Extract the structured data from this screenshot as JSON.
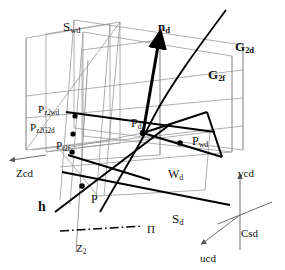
{
  "figure": {
    "type": "geometric-diagram",
    "background_color": "#ffffff",
    "line_color_thin": "#9a9a9a",
    "line_color_bold": "#000000"
  },
  "labels": {
    "plane_swd": {
      "base": "S",
      "sub": "wd",
      "x": 63,
      "y": 20,
      "size": 13,
      "bold": false
    },
    "plane_g2d": {
      "base": "G",
      "sub": "2d",
      "x": 235,
      "y": 40,
      "size": 13,
      "bold": true
    },
    "plane_g2f": {
      "base": "G",
      "sub": "2f",
      "x": 208,
      "y": 68,
      "size": 13,
      "bold": true
    },
    "plane_wd": {
      "base": "W",
      "sub": "d",
      "x": 168,
      "y": 168,
      "size": 12,
      "bold": false
    },
    "normal_nd": {
      "base": "n",
      "sub": "d",
      "x": 158,
      "y": 20,
      "size": 13,
      "bold": true
    },
    "point_pz2wd": {
      "base": "P",
      "sub": "z2wd",
      "x": 38,
      "y": 104,
      "size": 11,
      "bold": false
    },
    "point_pz2g2d": {
      "base": "P",
      "sub": "z2G2d",
      "x": 30,
      "y": 122,
      "size": 11,
      "bold": false
    },
    "point_pr2f": {
      "base": "P",
      "sub": "r2f",
      "x": 56,
      "y": 140,
      "size": 11,
      "bold": false
    },
    "point_pd": {
      "base": "P",
      "sub": "d",
      "x": 131,
      "y": 117,
      "size": 12,
      "bold": false
    },
    "point_pwd": {
      "base": "P",
      "sub": "wd",
      "x": 192,
      "y": 135,
      "size": 12,
      "bold": false
    },
    "point_p": {
      "base": "P",
      "sub": "",
      "x": 91,
      "y": 193,
      "size": 12,
      "bold": false
    },
    "line_h": {
      "base": "h",
      "sub": "",
      "x": 38,
      "y": 200,
      "size": 14,
      "bold": true
    },
    "line_sd": {
      "base": "S",
      "sub": "d",
      "x": 172,
      "y": 212,
      "size": 13,
      "bold": false
    },
    "axis_zcd": {
      "base": "Zcd",
      "sub": "",
      "x": 16,
      "y": 168,
      "size": 11,
      "bold": false
    },
    "axis_z2": {
      "base": "Z",
      "sub": "2",
      "x": 76,
      "y": 243,
      "size": 11,
      "bold": false
    },
    "plane_pi": {
      "base": "Π",
      "sub": "",
      "x": 147,
      "y": 224,
      "size": 11,
      "bold": false
    },
    "axis_vcd": {
      "base": "vcd",
      "sub": "",
      "x": 238,
      "y": 168,
      "size": 11,
      "bold": false
    },
    "axis_ucd": {
      "base": "ucd",
      "sub": "",
      "x": 200,
      "y": 253,
      "size": 11,
      "bold": false
    },
    "frame_csd": {
      "base": "Csd",
      "sub": "",
      "x": 241,
      "y": 228,
      "size": 11,
      "bold": false
    }
  },
  "geometry": {
    "points": [
      {
        "name": "P_z2wd",
        "x": 75,
        "y": 116
      },
      {
        "name": "P_z2G2d",
        "x": 73,
        "y": 134
      },
      {
        "name": "P_r2f",
        "x": 72,
        "y": 152
      },
      {
        "name": "P_d",
        "x": 143,
        "y": 133
      },
      {
        "name": "P_wd",
        "x": 180,
        "y": 143
      },
      {
        "name": "P",
        "x": 82,
        "y": 186
      }
    ]
  }
}
